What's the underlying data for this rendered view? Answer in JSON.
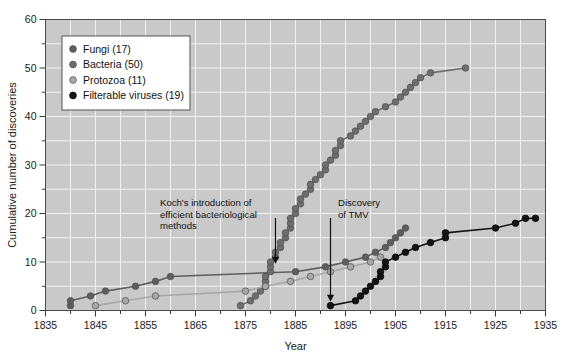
{
  "chart_data": {
    "type": "line",
    "title": "",
    "xlabel": "Year",
    "ylabel": "Cumulative number of discoveries",
    "xlim": [
      1835,
      1935
    ],
    "ylim": [
      0,
      60
    ],
    "xticks": [
      1835,
      1845,
      1855,
      1865,
      1875,
      1885,
      1895,
      1905,
      1915,
      1925,
      1935
    ],
    "yticks": [
      0,
      10,
      20,
      30,
      40,
      50,
      60
    ],
    "yminor_step": 5,
    "xminor_step": 5,
    "grid": true,
    "legend_position": "upper-left",
    "plot_background": "#c9c9c9",
    "grid_color": "#f2f2f2",
    "series": [
      {
        "name": "Fungi",
        "count": 17,
        "legend_label": "Fungi (17)",
        "color": "#5e5e5e",
        "points": [
          [
            1840,
            1
          ],
          [
            1840,
            2
          ],
          [
            1844,
            3
          ],
          [
            1847,
            4
          ],
          [
            1853,
            5
          ],
          [
            1857,
            6
          ],
          [
            1860,
            7
          ],
          [
            1885,
            8
          ],
          [
            1891,
            9
          ],
          [
            1895,
            10
          ],
          [
            1899,
            11
          ],
          [
            1901,
            12
          ],
          [
            1903,
            13
          ],
          [
            1904,
            14
          ],
          [
            1905,
            15
          ],
          [
            1906,
            16
          ],
          [
            1907,
            17
          ]
        ]
      },
      {
        "name": "Bacteria",
        "count": 50,
        "legend_label": "Bacteria (50)",
        "color": "#6e6e6e",
        "points": [
          [
            1874,
            1
          ],
          [
            1876,
            2
          ],
          [
            1877,
            3
          ],
          [
            1878,
            4
          ],
          [
            1879,
            5
          ],
          [
            1879,
            6
          ],
          [
            1879,
            7
          ],
          [
            1880,
            8
          ],
          [
            1880,
            9
          ],
          [
            1880,
            10
          ],
          [
            1881,
            11
          ],
          [
            1881,
            12
          ],
          [
            1882,
            13
          ],
          [
            1882,
            14
          ],
          [
            1883,
            15
          ],
          [
            1883,
            16
          ],
          [
            1884,
            17
          ],
          [
            1884,
            18
          ],
          [
            1884,
            19
          ],
          [
            1885,
            20
          ],
          [
            1885,
            21
          ],
          [
            1886,
            22
          ],
          [
            1886,
            23
          ],
          [
            1887,
            24
          ],
          [
            1888,
            25
          ],
          [
            1888,
            26
          ],
          [
            1889,
            27
          ],
          [
            1890,
            28
          ],
          [
            1891,
            29
          ],
          [
            1891,
            30
          ],
          [
            1892,
            31
          ],
          [
            1893,
            32
          ],
          [
            1893,
            33
          ],
          [
            1894,
            34
          ],
          [
            1894,
            35
          ],
          [
            1896,
            36
          ],
          [
            1897,
            37
          ],
          [
            1898,
            38
          ],
          [
            1899,
            39
          ],
          [
            1900,
            40
          ],
          [
            1901,
            41
          ],
          [
            1903,
            42
          ],
          [
            1905,
            43
          ],
          [
            1906,
            44
          ],
          [
            1907,
            45
          ],
          [
            1908,
            46
          ],
          [
            1909,
            47
          ],
          [
            1910,
            48
          ],
          [
            1912,
            49
          ],
          [
            1919,
            50
          ]
        ]
      },
      {
        "name": "Protozoa",
        "count": 11,
        "legend_label": "Protozoa (11)",
        "color": "#a8a8a8",
        "points": [
          [
            1845,
            1
          ],
          [
            1851,
            2
          ],
          [
            1857,
            3
          ],
          [
            1875,
            4
          ],
          [
            1879,
            5
          ],
          [
            1884,
            6
          ],
          [
            1888,
            7
          ],
          [
            1892,
            8
          ],
          [
            1896,
            9
          ],
          [
            1900,
            10
          ],
          [
            1902,
            11
          ]
        ]
      },
      {
        "name": "Filterable viruses",
        "count": 19,
        "legend_label": "Filterable viruses (19)",
        "color": "#141414",
        "points": [
          [
            1892,
            1
          ],
          [
            1897,
            2
          ],
          [
            1898,
            3
          ],
          [
            1899,
            4
          ],
          [
            1900,
            5
          ],
          [
            1901,
            6
          ],
          [
            1902,
            7
          ],
          [
            1902,
            8
          ],
          [
            1903,
            9
          ],
          [
            1903,
            10
          ],
          [
            1905,
            11
          ],
          [
            1907,
            12
          ],
          [
            1909,
            13
          ],
          [
            1912,
            14
          ],
          [
            1915,
            15
          ],
          [
            1915,
            16
          ],
          [
            1925,
            17
          ],
          [
            1929,
            18
          ],
          [
            1931,
            19
          ],
          [
            1933,
            19
          ]
        ]
      }
    ],
    "annotations": [
      {
        "id": "koch",
        "lines": [
          "Koch's introduction of",
          "efficient bacteriological",
          "methods"
        ],
        "arrow_year": 1881,
        "arrow_value": 9
      },
      {
        "id": "tmv",
        "lines": [
          "Discovery",
          "of TMV"
        ],
        "arrow_year": 1892,
        "arrow_value": 1
      }
    ]
  },
  "legend": {
    "items": [
      {
        "label": "Fungi (17)",
        "color": "#5e5e5e"
      },
      {
        "label": "Bacteria (50)",
        "color": "#6e6e6e"
      },
      {
        "label": "Protozoa (11)",
        "color": "#a8a8a8"
      },
      {
        "label": "Filterable viruses (19)",
        "color": "#141414"
      }
    ]
  },
  "axes": {
    "x_title": "Year",
    "y_title": "Cumulative number of discoveries",
    "x_tick_labels": [
      "1835",
      "1845",
      "1855",
      "1865",
      "1875",
      "1885",
      "1895",
      "1905",
      "1915",
      "1925",
      "1935"
    ],
    "y_tick_labels": [
      "0",
      "10",
      "20",
      "30",
      "40",
      "50",
      "60"
    ]
  },
  "annotation_text": {
    "koch_line1": "Koch's introduction of",
    "koch_line2": "efficient bacteriological",
    "koch_line3": "methods",
    "tmv_line1": "Discovery",
    "tmv_line2": "of TMV"
  }
}
